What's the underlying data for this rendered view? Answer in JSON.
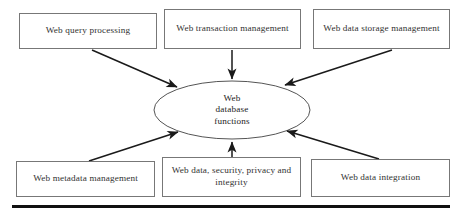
{
  "diagram": {
    "title": "Web database functions",
    "type": "hub-and-spoke",
    "center": {
      "name": "web-database-functions",
      "shape": "ellipse",
      "lines": [
        "Web",
        "database",
        "functions"
      ],
      "text": "Web database functions",
      "cx": 232,
      "cy": 110,
      "rx": 78,
      "ry": 29
    },
    "boxes": [
      {
        "id": "web-query-processing",
        "lines": [
          "Web query processing"
        ],
        "text": "Web query processing",
        "x": 19,
        "y": 13,
        "w": 138,
        "h": 36,
        "position": "top-left"
      },
      {
        "id": "web-transaction-management",
        "lines": [
          "Web transaction",
          "management"
        ],
        "text": "Web transaction management",
        "x": 164,
        "y": 9,
        "w": 137,
        "h": 40,
        "position": "top-center"
      },
      {
        "id": "web-data-storage-management",
        "lines": [
          "Web data storage",
          "management"
        ],
        "text": "Web data storage management",
        "x": 313,
        "y": 9,
        "w": 137,
        "h": 40,
        "position": "top-right"
      },
      {
        "id": "web-metadata-management",
        "lines": [
          "Web metadata management"
        ],
        "text": "Web metadata management",
        "x": 16,
        "y": 161,
        "w": 139,
        "h": 36,
        "position": "bottom-left"
      },
      {
        "id": "web-data-security-privacy-integrity",
        "lines": [
          "Web data, security,",
          "privacy and integrity"
        ],
        "text": "Web data, security, privacy and integrity",
        "x": 162,
        "y": 157,
        "w": 139,
        "h": 40,
        "position": "bottom-center"
      },
      {
        "id": "web-data-integration",
        "lines": [
          "Web data integration"
        ],
        "text": "Web data integration",
        "x": 311,
        "y": 159,
        "w": 139,
        "h": 38,
        "position": "bottom-right"
      }
    ],
    "arrows": [
      {
        "id": "arrow-query-processing-to-center",
        "from": "web-query-processing",
        "to": "web-database-functions",
        "x1": 92,
        "y1": 50,
        "x2": 177,
        "y2": 87
      },
      {
        "id": "arrow-transaction-management-to-center",
        "from": "web-transaction-management",
        "to": "web-database-functions",
        "x1": 232,
        "y1": 50,
        "x2": 232,
        "y2": 80
      },
      {
        "id": "arrow-data-storage-to-center",
        "from": "web-data-storage-management",
        "to": "web-database-functions",
        "x1": 390,
        "y1": 50,
        "x2": 285,
        "y2": 85
      },
      {
        "id": "arrow-metadata-management-to-center",
        "from": "web-metadata-management",
        "to": "web-database-functions",
        "x1": 89,
        "y1": 160,
        "x2": 178,
        "y2": 132
      },
      {
        "id": "arrow-data-security-to-center",
        "from": "web-data-security-privacy-integrity",
        "to": "web-database-functions",
        "x1": 232,
        "y1": 156,
        "x2": 232,
        "y2": 141
      },
      {
        "id": "arrow-data-integration-to-center",
        "from": "web-data-integration",
        "to": "web-database-functions",
        "x1": 378,
        "y1": 158,
        "x2": 287,
        "y2": 131
      }
    ],
    "rule": {
      "id": "bottom-rule",
      "x": 12,
      "y": 205,
      "w": 438,
      "h": 3
    },
    "colors": {
      "box_border": "#6d6d6d",
      "ellipse_border": "#555555",
      "arrow": "#1a1a1a",
      "text": "#1c1c1c",
      "rule": "#101010",
      "background": "#ffffff"
    }
  }
}
